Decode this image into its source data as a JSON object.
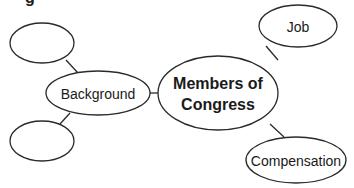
{
  "diagram": {
    "type": "concept-map",
    "partial_header_glyph": "g",
    "nodes": {
      "center": {
        "label_line1": "Members of",
        "label_line2": "Congress"
      },
      "background": {
        "label": "Background"
      },
      "job": {
        "label": "Job"
      },
      "compensation": {
        "label": "Compensation"
      },
      "empty_top": {
        "label": ""
      },
      "empty_bottom": {
        "label": ""
      }
    },
    "edges": [
      {
        "from": "center",
        "to": "background"
      },
      {
        "from": "center",
        "to": "job"
      },
      {
        "from": "center",
        "to": "compensation"
      },
      {
        "from": "background",
        "to": "empty_top"
      },
      {
        "from": "background",
        "to": "empty_bottom"
      }
    ],
    "colors": {
      "stroke": "#2a2a2a",
      "fill": "#ffffff",
      "text": "#1a1a1a"
    }
  }
}
